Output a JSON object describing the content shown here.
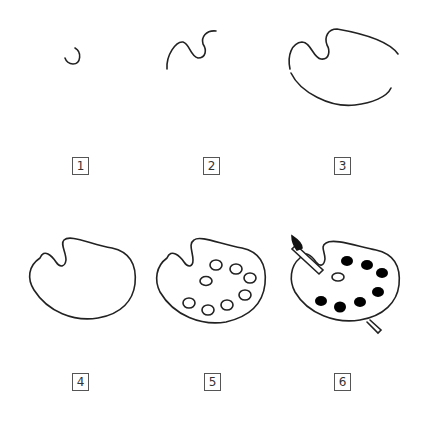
{
  "colors": {
    "stroke": "#222222",
    "paint": "#000000",
    "label_border": "#555555"
  },
  "steps": [
    {
      "number": "1",
      "description": "small hook curve"
    },
    {
      "number": "2",
      "description": "thumb hole curve"
    },
    {
      "number": "3",
      "description": "outer palette edge"
    },
    {
      "number": "4",
      "description": "complete palette outline"
    },
    {
      "number": "5",
      "description": "paint wells"
    },
    {
      "number": "6",
      "description": "filled paint and brush"
    }
  ]
}
